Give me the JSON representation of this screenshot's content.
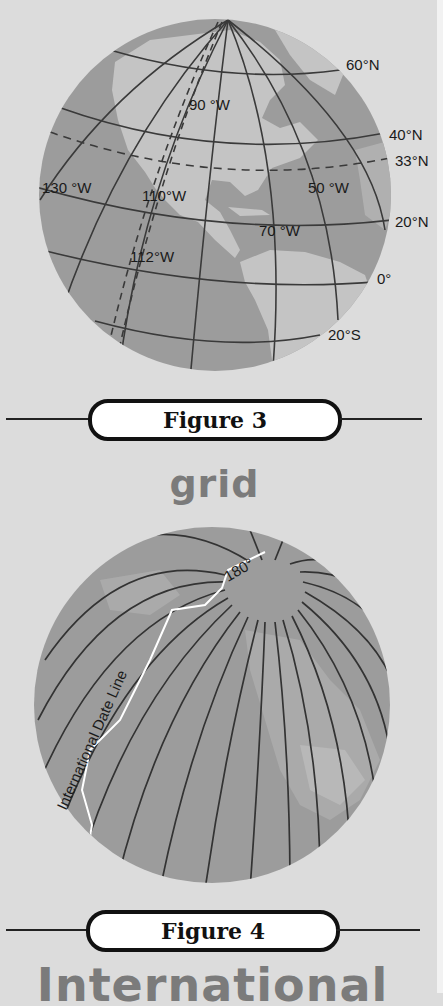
{
  "figure3": {
    "caption": "Figure 3",
    "term": "grid",
    "labels": {
      "lat_60N": "60°N",
      "lat_40N": "40°N",
      "lat_33N": "33°N",
      "lat_20N": "20°N",
      "lat_0": "0°",
      "lat_20S": "20°S",
      "lon_90W": "90 °W",
      "lon_130W": "130 °W",
      "lon_110W": "110°W",
      "lon_50W": "50 °W",
      "lon_70W": "70 °W",
      "lon_112W": "112°W"
    }
  },
  "figure4": {
    "caption": "Figure 4",
    "term": "International",
    "labels": {
      "meridian_180": "180°",
      "date_line": "International Date Line"
    }
  },
  "colors": {
    "background": "#dcdcdc",
    "ocean": "#9c9c9c",
    "land": "#c4c4c4",
    "grid_line": "#3a3a3a",
    "term_text": "#7b7b7b"
  }
}
